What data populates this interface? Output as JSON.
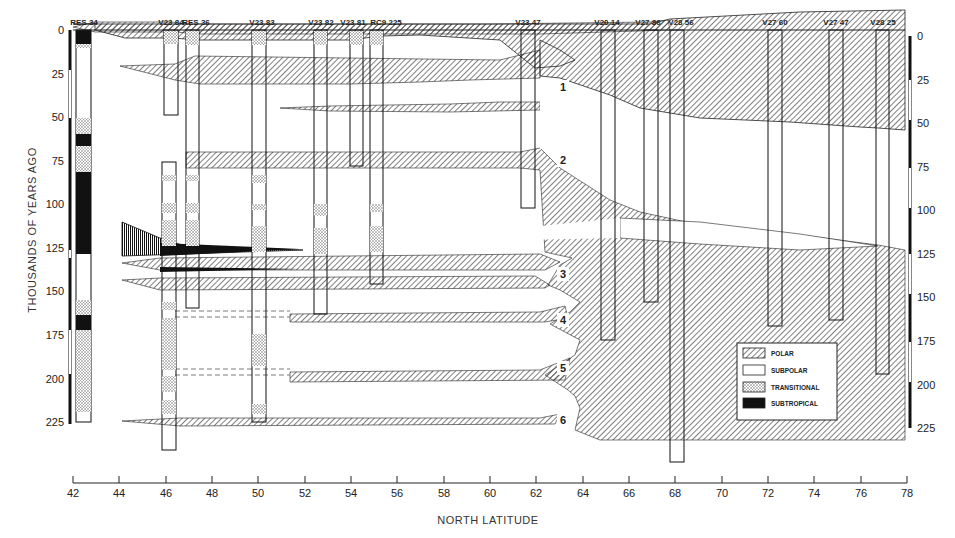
{
  "figure": {
    "x_axis_title": "NORTH LATITUDE",
    "y_axis_title": "THOUSANDS OF YEARS AGO",
    "x_ticks": [
      "42",
      "44",
      "46",
      "48",
      "50",
      "52",
      "54",
      "56",
      "58",
      "60",
      "62",
      "64",
      "66",
      "68",
      "70",
      "72",
      "74",
      "76",
      "78"
    ],
    "y_ticks_left": [
      "0",
      "25",
      "50",
      "75",
      "100",
      "125",
      "150",
      "175",
      "200",
      "225"
    ],
    "y_ticks_right": [
      "0",
      "25",
      "50",
      "75",
      "100",
      "125",
      "150",
      "175",
      "200",
      "225"
    ],
    "cores": [
      {
        "id": "RES 34",
        "lat": 42.6,
        "bottom_ka": 225
      },
      {
        "id": "V23 84",
        "lat": 46.0,
        "bottom_ka": 238
      },
      {
        "id": "RES 36",
        "lat": 47.0,
        "bottom_ka": 160
      },
      {
        "id": "V23 83",
        "lat": 50.0,
        "bottom_ka": 225
      },
      {
        "id": "V23 82",
        "lat": 52.6,
        "bottom_ka": 163
      },
      {
        "id": "V23 81",
        "lat": 54.2,
        "bottom_ka": 78
      },
      {
        "id": "RC9 225",
        "lat": 55.1,
        "bottom_ka": 146
      },
      {
        "id": "V23 47",
        "lat": 61.7,
        "bottom_ka": 102
      },
      {
        "id": "V20 14",
        "lat": 65.2,
        "bottom_ka": 178
      },
      {
        "id": "V27 86",
        "lat": 67.0,
        "bottom_ka": 156
      },
      {
        "id": "V28 56",
        "lat": 68.0,
        "bottom_ka": 248
      },
      {
        "id": "V27 60",
        "lat": 72.2,
        "bottom_ka": 170
      },
      {
        "id": "V27 47",
        "lat": 74.9,
        "bottom_ka": 166
      },
      {
        "id": "V28 25",
        "lat": 76.8,
        "bottom_ka": 196
      }
    ],
    "stage_labels": [
      "1",
      "2",
      "3",
      "4",
      "5",
      "6"
    ],
    "legend": {
      "items": [
        {
          "label": "POLAR",
          "pattern": "hatch"
        },
        {
          "label": "SUBPOLAR",
          "pattern": "blank"
        },
        {
          "label": "TRANSITIONAL",
          "pattern": "stipple"
        },
        {
          "label": "SUBTROPICAL",
          "pattern": "solid"
        }
      ]
    },
    "colors": {
      "ink": "#1a1a1a",
      "paper": "#ffffff",
      "hatch": "#3a3a3a",
      "stipple": "#555555"
    }
  }
}
